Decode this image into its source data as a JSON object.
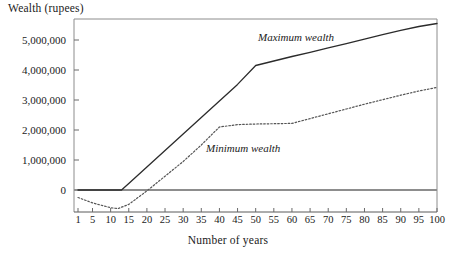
{
  "chart_data": {
    "type": "line",
    "title": "",
    "ylabel": "Wealth (rupees)",
    "xlabel": "Number of years",
    "grid": false,
    "legend_position": "inline-annotations",
    "xlim": [
      1,
      100
    ],
    "ylim": [
      -900000,
      5900000
    ],
    "yticks": [
      0,
      1000000,
      2000000,
      3000000,
      4000000,
      5000000
    ],
    "ytick_labels": [
      "0",
      "1,000,000",
      "2,000,000",
      "3,000,000",
      "4,000,000",
      "5,000,000"
    ],
    "xticks": [
      1,
      5,
      10,
      15,
      20,
      25,
      30,
      35,
      40,
      45,
      50,
      55,
      60,
      65,
      70,
      75,
      80,
      85,
      90,
      95,
      100
    ],
    "xtick_labels": [
      "1",
      "5",
      "10",
      "15",
      "20",
      "25",
      "30",
      "35",
      "40",
      "45",
      "50",
      "55",
      "60",
      "65",
      "70",
      "75",
      "80",
      "85",
      "90",
      "95",
      "100"
    ],
    "zero_line": 0,
    "series": [
      {
        "name": "Maximum wealth",
        "style": "solid",
        "color": "#2b2b2b",
        "x": [
          1,
          5,
          10,
          13,
          15,
          20,
          25,
          30,
          35,
          40,
          45,
          50,
          55,
          60,
          65,
          70,
          75,
          80,
          85,
          90,
          95,
          100
        ],
        "values": [
          0,
          0,
          0,
          0,
          220000,
          770000,
          1320000,
          1870000,
          2420000,
          2970000,
          3520000,
          4150000,
          4300000,
          4450000,
          4590000,
          4740000,
          4880000,
          5030000,
          5180000,
          5320000,
          5450000,
          5550000
        ]
      },
      {
        "name": "Minimum wealth",
        "style": "dotted",
        "color": "#555555",
        "x": [
          1,
          5,
          10,
          12,
          15,
          20,
          25,
          30,
          35,
          40,
          45,
          50,
          55,
          60,
          65,
          70,
          75,
          80,
          85,
          90,
          95,
          100
        ],
        "values": [
          -250000,
          -430000,
          -590000,
          -620000,
          -480000,
          -30000,
          460000,
          950000,
          1500000,
          2100000,
          2180000,
          2200000,
          2210000,
          2220000,
          2380000,
          2540000,
          2700000,
          2860000,
          3010000,
          3160000,
          3300000,
          3420000
        ]
      }
    ],
    "annotations": [
      {
        "text": "Maximum wealth",
        "series": "Maximum wealth"
      },
      {
        "text": "Minimum wealth",
        "series": "Minimum wealth"
      }
    ]
  },
  "axis_title_y": "Wealth (rupees)",
  "axis_title_x": "Number of years"
}
